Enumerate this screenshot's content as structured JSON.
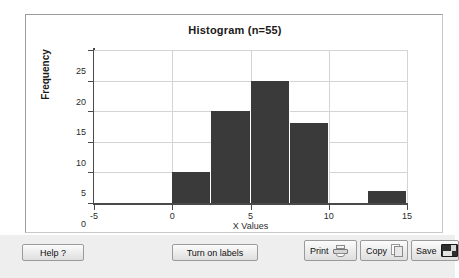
{
  "chart_data": {
    "type": "bar",
    "title": "Histogram (n=55)",
    "xlabel": "X Values",
    "ylabel": "Frequency",
    "xlim": [
      -5,
      15
    ],
    "ylim": [
      0,
      25
    ],
    "grid": true,
    "legend": "none",
    "bin_width": 2.5,
    "bin_edges": [
      0,
      2.5,
      5,
      7.5,
      10,
      12.5,
      15
    ],
    "bins": [
      {
        "start": 0,
        "end": 2.5,
        "frequency": 5
      },
      {
        "start": 2.5,
        "end": 5,
        "frequency": 15
      },
      {
        "start": 5,
        "end": 7.5,
        "frequency": 20
      },
      {
        "start": 7.5,
        "end": 10,
        "frequency": 13
      },
      {
        "start": 10,
        "end": 12.5,
        "frequency": 0
      },
      {
        "start": 12.5,
        "end": 15,
        "frequency": 2
      }
    ],
    "values": [
      5,
      15,
      20,
      13,
      2
    ],
    "xticks": [
      "-5",
      "0",
      "5",
      "10",
      "15"
    ],
    "xtick_values": [
      -5,
      0,
      5,
      10,
      15
    ],
    "yticks": [
      "0",
      "5",
      "10",
      "15",
      "20",
      "25"
    ],
    "ytick_values": [
      0,
      5,
      10,
      15,
      20,
      25
    ],
    "bar_color": "#3a3a3a",
    "grid_color": "#d4d4d4",
    "axis_color": "#4a4a4a",
    "plot_background": "#ffffff"
  },
  "toolbar": {
    "help_label": "Help ?",
    "labels_toggle_label": "Turn on labels",
    "print_label": "Print",
    "copy_label": "Copy",
    "save_label": "Save",
    "background": "#eeeeee"
  }
}
